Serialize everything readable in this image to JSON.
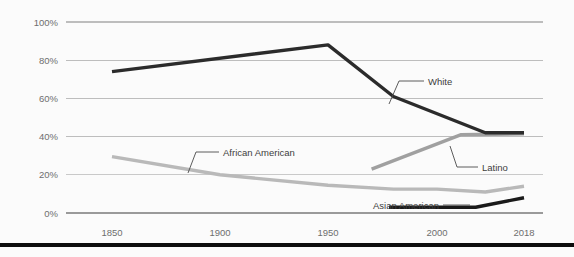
{
  "chart_data": {
    "type": "line",
    "title": "",
    "subtitle": "",
    "xlabel": "",
    "ylabel": "",
    "xlim": [
      1850,
      2018
    ],
    "ylim": [
      0,
      100
    ],
    "grid": true,
    "legend_position": "inline-labels",
    "x_ticks": [
      {
        "value": 1850,
        "label": "1850"
      },
      {
        "value": 1900,
        "label": "1900"
      },
      {
        "value": 1950,
        "label": "1950"
      },
      {
        "value": 2000,
        "label": "2000"
      },
      {
        "value": 2018,
        "label": "2018"
      }
    ],
    "y_ticks": [
      {
        "value": 100,
        "label": "100%"
      },
      {
        "value": 80,
        "label": "80%"
      },
      {
        "value": 60,
        "label": "60%"
      },
      {
        "value": 40,
        "label": "40%"
      },
      {
        "value": 20,
        "label": "20%"
      },
      {
        "value": 0,
        "label": "0%"
      }
    ],
    "series": [
      {
        "name": "White",
        "label": "White",
        "color": "#2b2b2b",
        "width": 3.4,
        "x": [
          1850,
          1950,
          1980,
          2010,
          2018
        ],
        "values": [
          74,
          88,
          61,
          42,
          42
        ]
      },
      {
        "name": "African American",
        "label": "African American",
        "color": "#b9b9b9",
        "width": 3.4,
        "x": [
          1850,
          1900,
          1950,
          1980,
          2000,
          2010,
          2018
        ],
        "values": [
          29.5,
          20,
          14.5,
          12.5,
          12.5,
          11,
          14
        ]
      },
      {
        "name": "Latino",
        "label": "Latino",
        "color": "#a0a0a0",
        "width": 3.4,
        "x": [
          1970,
          2005,
          2018
        ],
        "values": [
          23,
          41,
          41.5
        ]
      },
      {
        "name": "Asian American",
        "label": "Asian American",
        "color": "#1a1a1a",
        "width": 3.4,
        "x": [
          1978,
          2008,
          2018
        ],
        "values": [
          3,
          3,
          8
        ]
      }
    ]
  },
  "axis": {
    "y_labels": [
      "100%",
      "80%",
      "60%",
      "40%",
      "20%",
      "0%"
    ],
    "x_labels": [
      "1850",
      "1900",
      "1950",
      "2000",
      "2018"
    ]
  },
  "annotations": {
    "white": "White",
    "african_american": "African American",
    "latino": "Latino",
    "asian_american": "Asian American"
  },
  "colors": {
    "white_line": "#2b2b2b",
    "african_american_line": "#b9b9b9",
    "latino_line": "#a0a0a0",
    "asian_american_line": "#1a1a1a",
    "gridline": "#b6b6b6",
    "axis_line": "#9a9a9a",
    "tick_text": "#6e6e6e",
    "label_text": "#3d3d3d",
    "background": "#fbfbfb",
    "bottom_bar": "#0d0d0d"
  }
}
